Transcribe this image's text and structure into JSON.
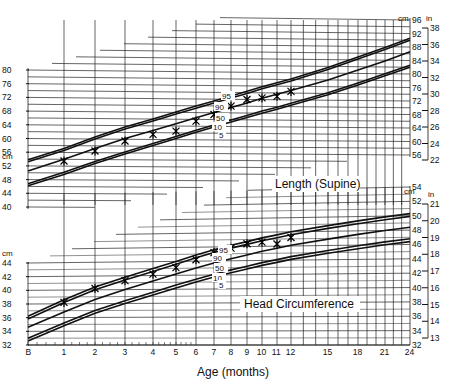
{
  "chart_data": [
    {
      "type": "line",
      "title": "Length (Supine)",
      "xlabel": "Age (months)",
      "ylabel": "cm",
      "ylabel_right": "in",
      "x_ticks": [
        0,
        1,
        2,
        3,
        4,
        5,
        6,
        7,
        8,
        9,
        10,
        11,
        12,
        15,
        18,
        21,
        24
      ],
      "y_ticks_left_cm": [
        40,
        44,
        48,
        52,
        56,
        60,
        64,
        68,
        72,
        76,
        80
      ],
      "y_ticks_right_cm": [
        56,
        60,
        64,
        68,
        72,
        76,
        80,
        84,
        88,
        92,
        96
      ],
      "y_ticks_right_in": [
        22,
        24,
        26,
        28,
        30,
        32,
        34,
        36,
        38
      ],
      "ylim_cm": [
        40,
        96
      ],
      "grid": true,
      "x": [
        0,
        1,
        2,
        3,
        4,
        5,
        6,
        7,
        8,
        9,
        10,
        11,
        12,
        15,
        18,
        21,
        24
      ],
      "series": [
        {
          "name": "95",
          "values": [
            53.8,
            57.2,
            60.6,
            63.6,
            66.0,
            68.1,
            69.9,
            71.5,
            73.0,
            74.4,
            75.8,
            77.0,
            78.2,
            81.7,
            84.9,
            87.8,
            90.6
          ]
        },
        {
          "name": "90",
          "values": [
            53.2,
            56.6,
            60.0,
            63.0,
            65.4,
            67.5,
            69.3,
            70.9,
            72.4,
            73.8,
            75.2,
            76.4,
            77.6,
            81.1,
            84.3,
            87.2,
            90.0
          ]
        },
        {
          "name": "50",
          "values": [
            50.5,
            54.0,
            57.2,
            60.2,
            62.6,
            64.7,
            66.5,
            68.1,
            69.6,
            71.0,
            72.4,
            73.6,
            74.8,
            78.0,
            81.0,
            83.8,
            86.6
          ]
        },
        {
          "name": "10",
          "values": [
            46.8,
            50.2,
            53.4,
            56.3,
            58.8,
            60.9,
            62.8,
            64.4,
            65.9,
            67.3,
            68.6,
            69.8,
            71.0,
            74.2,
            77.2,
            80.0,
            82.6
          ]
        },
        {
          "name": "5",
          "values": [
            46.2,
            49.6,
            52.8,
            55.7,
            58.2,
            60.3,
            62.2,
            63.8,
            65.3,
            66.7,
            68.0,
            69.2,
            70.4,
            73.6,
            76.6,
            79.4,
            82.0
          ]
        },
        {
          "name": "Patient",
          "marker": "x",
          "x": [
            1,
            2,
            3,
            4,
            5,
            6,
            7,
            8,
            9,
            10,
            11,
            12
          ],
          "values": [
            53.5,
            56.5,
            59.5,
            61.5,
            62.5,
            65.5,
            67.5,
            70,
            72,
            72.5,
            73,
            74.5
          ]
        }
      ],
      "annotations": [
        "95",
        "90",
        "50",
        "10",
        "5"
      ]
    },
    {
      "type": "line",
      "title": "Head Circumference",
      "xlabel": "Age (months)",
      "ylabel": "cm",
      "ylabel_right": "in",
      "x_ticks": [
        0,
        1,
        2,
        3,
        4,
        5,
        6,
        7,
        8,
        9,
        10,
        11,
        12,
        15,
        18,
        21,
        24
      ],
      "y_ticks_left_cm": [
        32,
        34,
        36,
        38,
        40,
        42,
        44
      ],
      "y_ticks_right_cm": [
        32,
        34,
        36,
        38,
        40,
        42,
        44,
        46,
        48,
        50,
        52,
        54
      ],
      "y_ticks_right_in": [
        13,
        14,
        15,
        16,
        17,
        18,
        19,
        20,
        21
      ],
      "ylim_cm": [
        32,
        54
      ],
      "grid": true,
      "x": [
        0,
        1,
        2,
        3,
        4,
        5,
        6,
        7,
        8,
        9,
        10,
        11,
        12,
        15,
        18,
        21,
        24
      ],
      "series": [
        {
          "name": "95",
          "values": [
            36.2,
            38.6,
            40.4,
            41.8,
            43.0,
            44.0,
            44.9,
            45.6,
            46.2,
            46.7,
            47.2,
            47.6,
            48.0,
            48.8,
            49.4,
            49.9,
            50.3
          ]
        },
        {
          "name": "90",
          "values": [
            35.8,
            38.2,
            40.0,
            41.4,
            42.6,
            43.6,
            44.5,
            45.2,
            45.8,
            46.3,
            46.8,
            47.2,
            47.6,
            48.4,
            49.0,
            49.5,
            49.9
          ]
        },
        {
          "name": "50",
          "values": [
            34.6,
            36.8,
            38.6,
            40.0,
            41.2,
            42.2,
            43.0,
            43.7,
            44.3,
            44.8,
            45.3,
            45.7,
            46.1,
            46.9,
            47.5,
            48.0,
            48.4
          ]
        },
        {
          "name": "10",
          "values": [
            33.0,
            35.2,
            37.0,
            38.4,
            39.6,
            40.6,
            41.4,
            42.1,
            42.7,
            43.2,
            43.7,
            44.1,
            44.5,
            45.3,
            45.9,
            46.4,
            46.8
          ]
        },
        {
          "name": "5",
          "values": [
            32.6,
            34.8,
            36.6,
            38.0,
            39.2,
            40.2,
            41.0,
            41.7,
            42.3,
            42.8,
            43.3,
            43.7,
            44.1,
            44.9,
            45.5,
            46.0,
            46.4
          ]
        },
        {
          "name": "Patient",
          "marker": "x",
          "x": [
            1,
            2,
            3,
            4,
            5,
            6,
            7,
            8,
            9,
            10,
            11,
            12
          ],
          "values": [
            38.2,
            40.2,
            41.3,
            42.2,
            43.1,
            44.2,
            45.2,
            45.8,
            46.4,
            46.6,
            46.3,
            47.2
          ]
        }
      ],
      "annotations": [
        "95",
        "90",
        "50",
        "10",
        "5"
      ]
    }
  ],
  "labels": {
    "length_title": "Length (Supine)",
    "head_title": "Head Circumference",
    "xlabel": "Age (months)",
    "unit_cm": "cm",
    "unit_in": "in",
    "pct_95": "95",
    "pct_90": "90",
    "pct_50": "50",
    "pct_10": "10",
    "pct_5": "5",
    "x_origin": "B"
  }
}
